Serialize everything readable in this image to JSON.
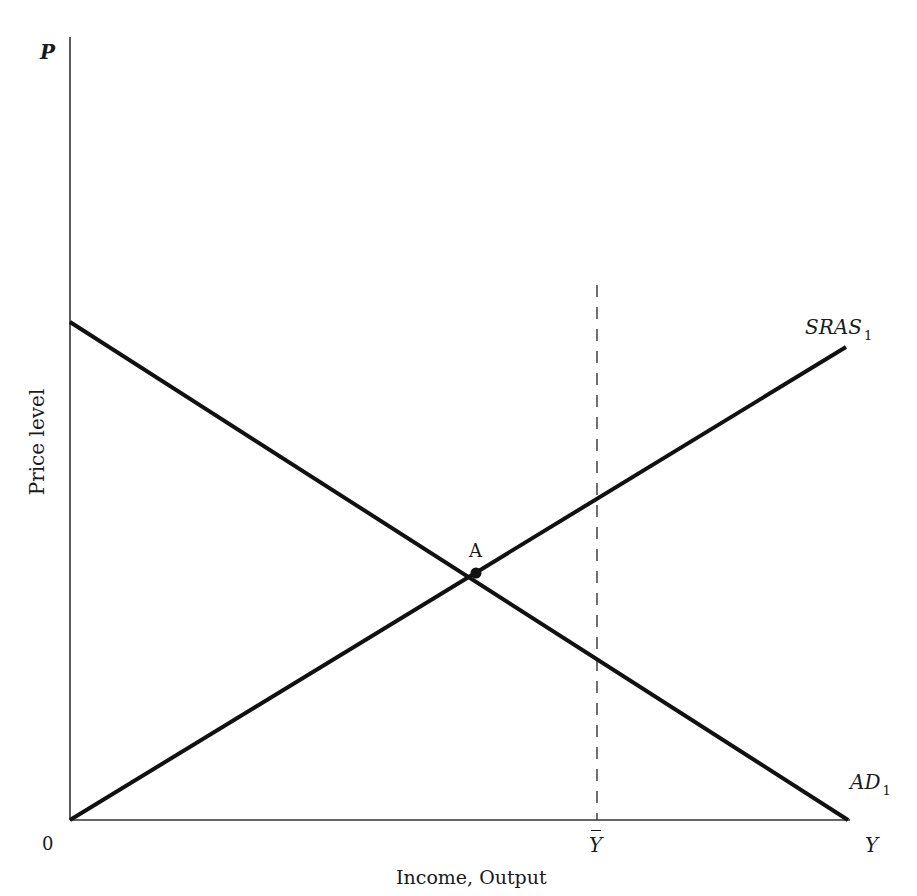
{
  "diagram": {
    "type": "AD-AS model",
    "axes": {
      "y_label_symbol": "P",
      "y_title": "Price level",
      "x_label_symbol": "Y",
      "x_title": "Income, Output",
      "origin": "0",
      "potential_output_symbol": "Y"
    },
    "curves": [
      {
        "name": "SRAS",
        "subscript": "1",
        "slope": "upward"
      },
      {
        "name": "AD",
        "subscript": "1",
        "slope": "downward"
      }
    ],
    "points": [
      {
        "label": "A",
        "description": "equilibrium at intersection of AD1 and SRAS1"
      }
    ],
    "reference_lines": [
      {
        "label": "Ȳ",
        "style": "dashed vertical",
        "description": "potential output"
      }
    ],
    "colors": {
      "ink": "#1a1a1a",
      "background": "#ffffff"
    }
  }
}
